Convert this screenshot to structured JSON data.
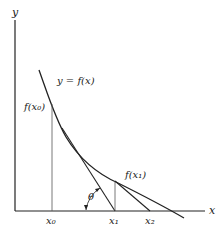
{
  "diagram": {
    "axes": {
      "x_label": "x",
      "y_label": "y"
    },
    "curve_label": "y = f(x)",
    "points": [
      {
        "name": "x0",
        "label": "x₀",
        "value_label": "f(x₀)"
      },
      {
        "name": "x1",
        "label": "x₁",
        "value_label": "f(x₁)"
      },
      {
        "name": "x2",
        "label": "x₂"
      }
    ],
    "angle_label": "θ",
    "colors": {
      "ink": "#222222",
      "thin": "#555555",
      "background": "#ffffff"
    }
  }
}
